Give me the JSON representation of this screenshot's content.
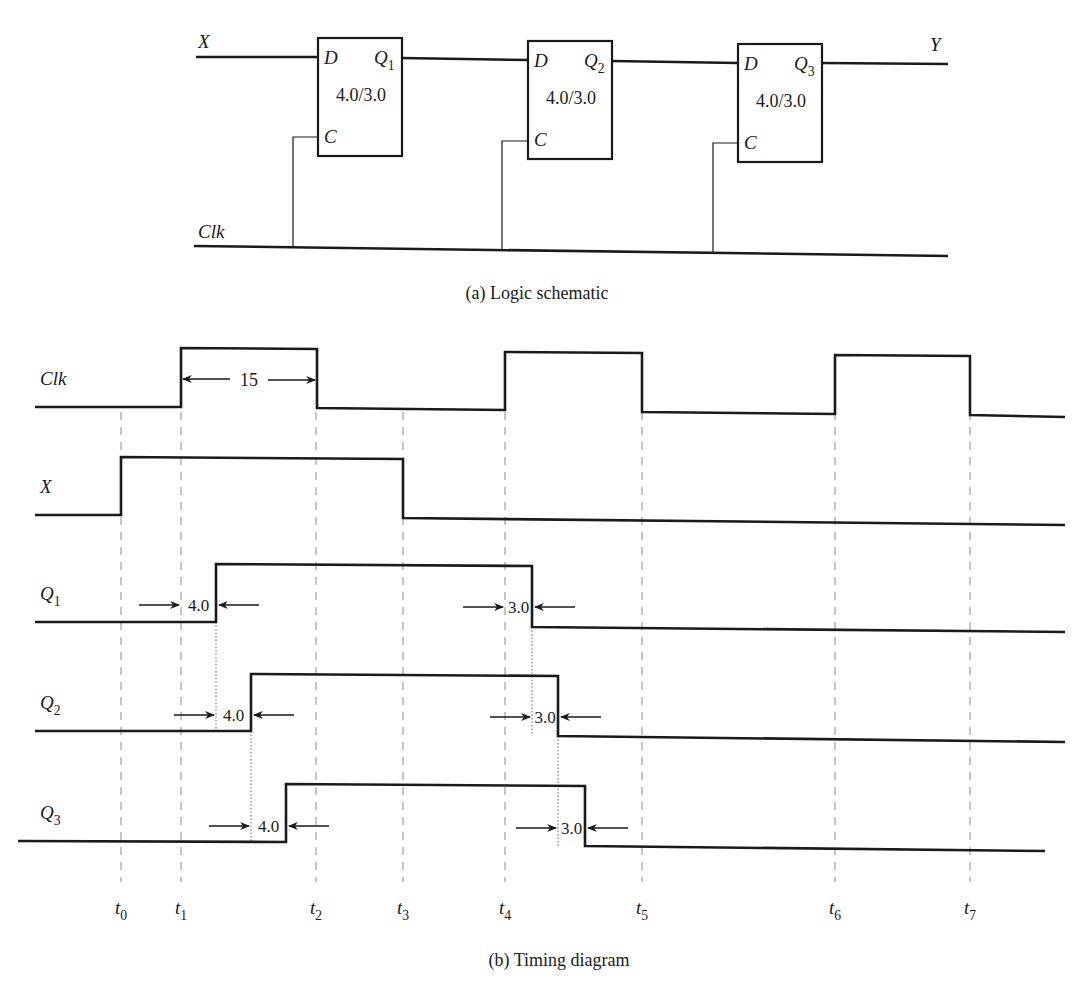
{
  "schematic": {
    "caption": "(a)  Logic schematic",
    "input_label": "X",
    "output_label": "Y",
    "clock_label": "Clk",
    "flip_flops": [
      {
        "d_label": "D",
        "q_label": "Q",
        "q_sub": "1",
        "c_label": "C",
        "delay": "4.0/3.0",
        "x": 318,
        "y": 38
      },
      {
        "d_label": "D",
        "q_label": "Q",
        "q_sub": "2",
        "c_label": "C",
        "delay": "4.0/3.0",
        "x": 528,
        "y": 41
      },
      {
        "d_label": "D",
        "q_label": "Q",
        "q_sub": "3",
        "c_label": "C",
        "delay": "4.0/3.0",
        "x": 738,
        "y": 44
      }
    ]
  },
  "timing": {
    "caption": "(b)  Timing diagram",
    "clock_width_label": "15",
    "signals": [
      {
        "name": "Clk",
        "sub": "",
        "base_y": 407,
        "high_y": 348,
        "points": [
          [
            35,
            407
          ],
          [
            181,
            407
          ],
          [
            181,
            348
          ],
          [
            317,
            349
          ],
          [
            317,
            408
          ],
          [
            505,
            410
          ],
          [
            505,
            352
          ],
          [
            642,
            353
          ],
          [
            642,
            412
          ],
          [
            835,
            414
          ],
          [
            835,
            355
          ],
          [
            970,
            356
          ],
          [
            970,
            415
          ],
          [
            1065,
            417
          ]
        ]
      },
      {
        "name": "X",
        "sub": "",
        "base_y": 515,
        "high_y": 457,
        "points": [
          [
            35,
            515
          ],
          [
            121,
            515
          ],
          [
            121,
            457
          ],
          [
            403,
            459
          ],
          [
            403,
            518
          ],
          [
            1065,
            525
          ]
        ]
      },
      {
        "name": "Q",
        "sub": "1",
        "base_y": 622,
        "high_y": 564,
        "points": [
          [
            35,
            622
          ],
          [
            216,
            622
          ],
          [
            216,
            564
          ],
          [
            532,
            566
          ],
          [
            532,
            627
          ],
          [
            1065,
            632
          ]
        ]
      },
      {
        "name": "Q",
        "sub": "2",
        "base_y": 731,
        "high_y": 674,
        "points": [
          [
            35,
            731
          ],
          [
            251,
            731
          ],
          [
            251,
            674
          ],
          [
            558,
            676
          ],
          [
            558,
            736
          ],
          [
            1065,
            742
          ]
        ]
      },
      {
        "name": "Q",
        "sub": "3",
        "base_y": 841,
        "high_y": 784,
        "points": [
          [
            18,
            841
          ],
          [
            286,
            842
          ],
          [
            286,
            784
          ],
          [
            585,
            786
          ],
          [
            585,
            846
          ],
          [
            1045,
            851
          ]
        ]
      }
    ],
    "delay_annotations": [
      {
        "label": "4.0",
        "signal": "Q1",
        "x1": 181,
        "x2": 216,
        "y": 605
      },
      {
        "label": "3.0",
        "signal": "Q1",
        "x1": 505,
        "x2": 532,
        "y": 607
      },
      {
        "label": "4.0",
        "signal": "Q2",
        "x1": 216,
        "x2": 251,
        "y": 715
      },
      {
        "label": "3.0",
        "signal": "Q2",
        "x1": 532,
        "x2": 558,
        "y": 717
      },
      {
        "label": "4.0",
        "signal": "Q3",
        "x1": 251,
        "x2": 286,
        "y": 826
      },
      {
        "label": "3.0",
        "signal": "Q3",
        "x1": 558,
        "x2": 585,
        "y": 828
      }
    ],
    "time_markers": [
      {
        "label": "t",
        "sub": "0",
        "x": 121
      },
      {
        "label": "t",
        "sub": "1",
        "x": 181
      },
      {
        "label": "t",
        "sub": "2",
        "x": 316
      },
      {
        "label": "t",
        "sub": "3",
        "x": 403
      },
      {
        "label": "t",
        "sub": "4",
        "x": 505
      },
      {
        "label": "t",
        "sub": "5",
        "x": 642
      },
      {
        "label": "t",
        "sub": "6",
        "x": 835
      },
      {
        "label": "t",
        "sub": "7",
        "x": 970
      }
    ]
  }
}
